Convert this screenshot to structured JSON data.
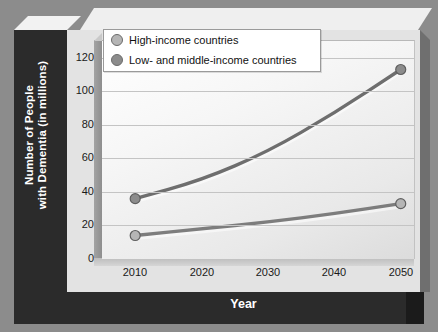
{
  "chart_data": {
    "type": "line",
    "title": "",
    "xlabel": "Year",
    "ylabel": "Number of People with Dementia (in millions)",
    "ylabel_line1": "Number of People",
    "ylabel_line2": "with Dementia (in millions)",
    "categories": [
      "2010",
      "2020",
      "2030",
      "2040",
      "2050"
    ],
    "x": [
      2010,
      2020,
      2030,
      2040,
      2050
    ],
    "xlim": [
      2005,
      2052
    ],
    "ylim": [
      0,
      130
    ],
    "yticks": [
      "0",
      "20",
      "40",
      "60",
      "80",
      "100",
      "120"
    ],
    "ytick_values": [
      0,
      20,
      40,
      60,
      80,
      100,
      120
    ],
    "grid": true,
    "legend_position": "top-left",
    "series": [
      {
        "name": "High-income countries",
        "marker_color": "#b5b5b5",
        "line_color": "#7d7d7d",
        "values": [
          14,
          18,
          22,
          27,
          33
        ]
      },
      {
        "name": "Low- and middle-income countries",
        "marker_color": "#8c8c8c",
        "line_color": "#6e6e6e",
        "values": [
          36,
          47,
          64,
          87,
          113
        ]
      }
    ]
  },
  "colors": {
    "page_background": "#8c8c8c",
    "frame_dark": "#2b2b2b",
    "panel": "#e3e3e3",
    "plot_light": "#ffffff",
    "gridline": "#c4c4c4",
    "axis_title_text": "#ffffff",
    "tick_text": "#1a1a1a"
  }
}
